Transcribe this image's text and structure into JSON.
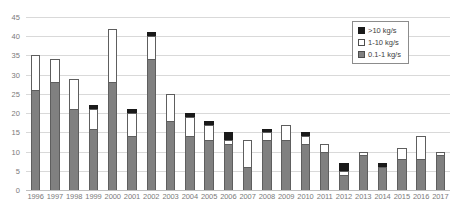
{
  "chart_data": {
    "type": "bar",
    "title": "",
    "subtitle": "",
    "xlabel": "",
    "ylabel": "",
    "stacked": true,
    "grid": true,
    "legend_position": "top-right",
    "ylim": [
      0,
      45
    ],
    "yticks": [
      0,
      5,
      10,
      15,
      20,
      25,
      30,
      35,
      40,
      45
    ],
    "categories": [
      "1996",
      "1997",
      "1998",
      "1999",
      "2000",
      "2001",
      "2002",
      "2003",
      "2004",
      "2005",
      "2006",
      "2007",
      "2008",
      "2009",
      "2010",
      "2011",
      "2012",
      "2013",
      "2014",
      "2015",
      "2016",
      "2017"
    ],
    "series": [
      {
        "name": "0.1-1 kg/s",
        "color": "#808080",
        "values": [
          26,
          28,
          21,
          16,
          28,
          14,
          34,
          18,
          14,
          13,
          12,
          6,
          13,
          13,
          12,
          10,
          4,
          9,
          6,
          8,
          8,
          9
        ]
      },
      {
        "name": "1-10 kg/s",
        "color": "#ffffff",
        "values": [
          9,
          6,
          8,
          5,
          14,
          6,
          6,
          7,
          5,
          4,
          1,
          7,
          2,
          4,
          2,
          2,
          1,
          1,
          0,
          3,
          6,
          1
        ]
      },
      {
        "name": ">10 kg/s",
        "color": "#1a1a1a",
        "values": [
          0,
          0,
          0,
          1,
          0,
          1,
          1,
          0,
          1,
          1,
          2,
          0,
          1,
          0,
          1,
          0,
          2,
          0,
          1,
          0,
          0,
          0
        ]
      }
    ],
    "totals": [
      35,
      34,
      29,
      22,
      42,
      21,
      41,
      25,
      20,
      18,
      15,
      13,
      16,
      17,
      15,
      12,
      7,
      10,
      7,
      11,
      14,
      10
    ]
  },
  "legend": {
    "items": [
      {
        "label": ">10 kg/s",
        "swatch": "black-square"
      },
      {
        "label": "1-10 kg/s",
        "swatch": "white-square"
      },
      {
        "label": "0.1-1 kg/s",
        "swatch": "gray-square"
      }
    ]
  }
}
